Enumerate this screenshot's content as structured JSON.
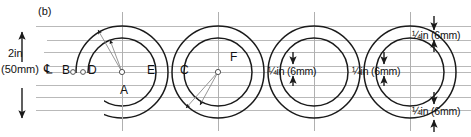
{
  "figure": {
    "panel_label": "(b)",
    "centerline_symbol": "℄",
    "height_dimension": {
      "value": "2in",
      "metric": "(50mm)"
    },
    "point_labels": [
      {
        "id": "B",
        "text": "B",
        "x": 62,
        "y": 70
      },
      {
        "id": "D",
        "text": "D",
        "x": 88,
        "y": 70
      },
      {
        "id": "A",
        "text": "A",
        "x": 122,
        "y": 90
      },
      {
        "id": "E",
        "text": "E",
        "x": 148,
        "y": 70
      },
      {
        "id": "C",
        "text": "C",
        "x": 180,
        "y": 70
      },
      {
        "id": "F",
        "text": "F",
        "x": 218,
        "y": 58
      }
    ],
    "spacing_dimensions": [
      {
        "id": "dim-top-right",
        "label": "¼in (6mm)",
        "x": 412,
        "y": 35
      },
      {
        "id": "dim-mid-left",
        "label": "¼in (6mm)",
        "x": 268,
        "y": 70
      },
      {
        "id": "dim-mid-right",
        "label": "¼in (6mm)",
        "x": 352,
        "y": 70
      },
      {
        "id": "dim-bottom-right",
        "label": "¼in (6mm)",
        "x": 412,
        "y": 112
      }
    ],
    "geometry": {
      "guide_lines_y": [
        26,
        40,
        52,
        66,
        72,
        85,
        97,
        110
      ],
      "baseline_y": 72,
      "circle_centers_x": [
        122,
        218,
        314,
        410
      ],
      "outer_radius": 46,
      "inner_radius": 34,
      "vertical_centerlines_x": [
        122,
        218,
        314,
        410
      ],
      "circle_stroke": "#1a1a1a",
      "guide_stroke": "#b9b9b9",
      "construction_stroke": "#8a8a8a",
      "text_color": "#111111"
    }
  }
}
